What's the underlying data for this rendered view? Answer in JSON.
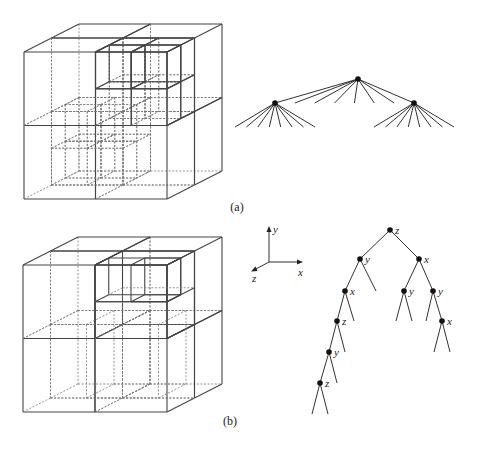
{
  "figure": {
    "captions": {
      "a": "(a)",
      "b": "(b)"
    },
    "panel_a": {
      "description": "Octree subdivision of a cube and its corresponding octree",
      "tree": {
        "type": "octree",
        "branching_factor": 8,
        "root": {
          "children": [
            {
              "leaf": false,
              "children_leaves": 8
            },
            {
              "leaf": true
            },
            {
              "leaf": true
            },
            {
              "leaf": true
            },
            {
              "leaf": true
            },
            {
              "leaf": true
            },
            {
              "leaf": true
            },
            {
              "leaf": false,
              "children_leaves": 8
            }
          ]
        }
      }
    },
    "panel_b": {
      "description": "k-d tree subdivision of a cube and its corresponding binary tree",
      "axes": {
        "x_label": "x",
        "y_label": "y",
        "z_label": "z"
      },
      "tree": {
        "type": "kd-tree",
        "nodes": [
          {
            "id": "n0",
            "split": "z",
            "parent": null
          },
          {
            "id": "n1",
            "split": "y",
            "parent": "n0"
          },
          {
            "id": "n2",
            "split": "x",
            "parent": "n0"
          },
          {
            "id": "n3",
            "split": "x",
            "parent": "n1"
          },
          {
            "id": "n4",
            "split": "y",
            "parent": "n2"
          },
          {
            "id": "n5",
            "split": "y",
            "parent": "n2"
          },
          {
            "id": "n6",
            "split": "z",
            "parent": "n3"
          },
          {
            "id": "n7",
            "split": "x",
            "parent": "n5"
          },
          {
            "id": "n8",
            "split": "y",
            "parent": "n6"
          },
          {
            "id": "n9",
            "split": "z",
            "parent": "n8"
          }
        ]
      }
    }
  }
}
